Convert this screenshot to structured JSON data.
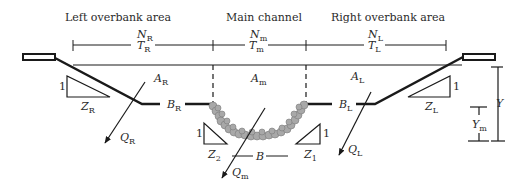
{
  "diagram": {
    "type": "compound channel cross-section",
    "regions": [
      {
        "id": "left",
        "title": "Left overbank area",
        "n": "N",
        "n_sub": "R",
        "t": "T",
        "t_sub": "R",
        "a": "A",
        "a_sub": "R",
        "b": "B",
        "b_sub": "R",
        "z": "Z",
        "z_sub": "R",
        "q": "Q",
        "q_sub": "R"
      },
      {
        "id": "main",
        "title": "Main channel",
        "n": "N",
        "n_sub": "m",
        "t": "T",
        "t_sub": "m",
        "a": "A",
        "a_sub": "m",
        "b": "B",
        "q": "Q",
        "q_sub": "m",
        "z_left": "Z",
        "z_left_sub": "2",
        "z_right": "Z",
        "z_right_sub": "1"
      },
      {
        "id": "right",
        "title": "Right overbank area",
        "n": "N",
        "n_sub": "L",
        "t": "T",
        "t_sub": "L",
        "a": "A",
        "a_sub": "L",
        "b": "B",
        "b_sub": "L",
        "z": "Z",
        "z_sub": "L",
        "q": "Q",
        "q_sub": "L"
      }
    ],
    "slope_unit": "1",
    "depth": {
      "total": "Y",
      "main": "Y",
      "main_sub": "m"
    },
    "colors": {
      "line": "#1a1a1a",
      "bed_stone": "#a8a8a8",
      "bed_stone_edge": "#7a7a7a"
    }
  }
}
